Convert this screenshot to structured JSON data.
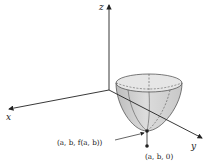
{
  "diagram": {
    "axes": {
      "x_label": "x",
      "y_label": "y",
      "z_label": "z"
    },
    "surface": "paraboloid",
    "points": {
      "on_surface_label": "(a, b, f(a, b))",
      "on_plane_label": "(a, b, 0)"
    },
    "colors": {
      "surface_fill": "#d2d2d2",
      "surface_top": "#e4e4e4",
      "lines": "#333333"
    }
  }
}
